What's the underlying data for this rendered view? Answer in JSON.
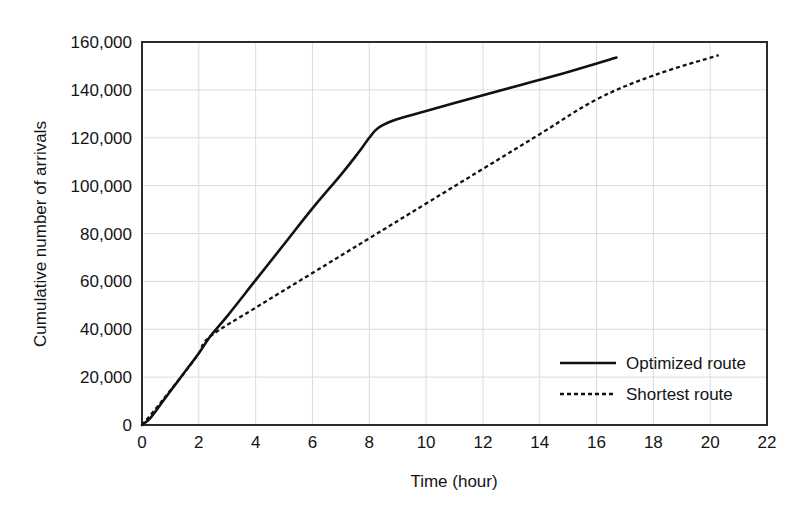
{
  "chart_data": {
    "type": "line",
    "title": "",
    "subtitle": "",
    "xlabel": "Time (hour)",
    "ylabel": "Cumulative number of arrivals",
    "xlim": [
      0,
      22
    ],
    "ylim": [
      0,
      160000
    ],
    "xticks": [
      0,
      2,
      4,
      6,
      8,
      10,
      12,
      14,
      16,
      18,
      20,
      22
    ],
    "xticklabels": [
      "0",
      "2",
      "4",
      "6",
      "8",
      "10",
      "12",
      "14",
      "16",
      "18",
      "20",
      "22"
    ],
    "yticks": [
      0,
      20000,
      40000,
      60000,
      80000,
      100000,
      120000,
      140000,
      160000
    ],
    "yticklabels": [
      "0",
      "20,000",
      "40,000",
      "60,000",
      "80,000",
      "100,000",
      "120,000",
      "140,000",
      "160,000"
    ],
    "grid": "horizontal-and-vertical-light",
    "legend_position": "lower-right-inside",
    "series": [
      {
        "name": "Optimized route",
        "style": "solid",
        "color": "#111111",
        "points": [
          [
            0.0,
            0
          ],
          [
            0.3,
            3000
          ],
          [
            0.8,
            11000
          ],
          [
            1.4,
            20500
          ],
          [
            2.0,
            30000
          ],
          [
            2.4,
            37000
          ],
          [
            3.0,
            45500
          ],
          [
            4.0,
            60500
          ],
          [
            5.0,
            75500
          ],
          [
            6.0,
            90500
          ],
          [
            7.0,
            104500
          ],
          [
            7.6,
            113500
          ],
          [
            8.0,
            120000
          ],
          [
            8.3,
            124000
          ],
          [
            8.8,
            127000
          ],
          [
            9.5,
            129500
          ],
          [
            11.0,
            134500
          ],
          [
            13.0,
            141000
          ],
          [
            15.0,
            147500
          ],
          [
            16.7,
            153500
          ]
        ]
      },
      {
        "name": "Shortest route",
        "style": "dashed",
        "color": "#111111",
        "points": [
          [
            0.0,
            0
          ],
          [
            0.5,
            7000
          ],
          [
            1.0,
            14500
          ],
          [
            1.6,
            23500
          ],
          [
            2.0,
            30000
          ],
          [
            2.4,
            37000
          ],
          [
            4.0,
            49000
          ],
          [
            6.0,
            63500
          ],
          [
            8.0,
            78000
          ],
          [
            10.0,
            92500
          ],
          [
            12.0,
            107000
          ],
          [
            14.0,
            121500
          ],
          [
            16.0,
            136000
          ],
          [
            18.0,
            146000
          ],
          [
            20.3,
            154500
          ]
        ]
      }
    ]
  },
  "axes": {
    "x_title": "Time (hour)",
    "y_title": "Cumulative number of arrivals"
  },
  "legend": {
    "entries": [
      {
        "label": "Optimized route",
        "style": "solid"
      },
      {
        "label": "Shortest route",
        "style": "dashed"
      }
    ]
  }
}
